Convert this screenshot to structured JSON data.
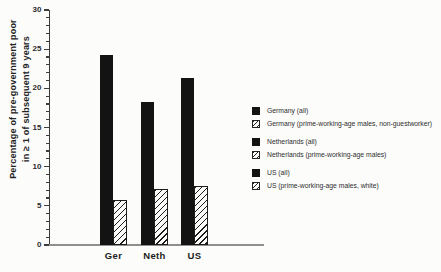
{
  "page": {
    "background": "#fcfcfb",
    "ink": "#161616"
  },
  "chart_data": {
    "type": "bar",
    "title": "",
    "xlabel": "",
    "ylabel_lines": [
      "Percentage of pre-government poor",
      "in ≥ 1 of subsequent 9 years"
    ],
    "ylim": [
      0,
      30
    ],
    "yticks": [
      0,
      5,
      10,
      15,
      20,
      25,
      30
    ],
    "ytick_step": 5,
    "minor_tick_step": 1,
    "grid": false,
    "categories": [
      "Ger",
      "Neth",
      "US"
    ],
    "series": [
      {
        "name": "all",
        "style": "solid",
        "color": "#131313",
        "values": [
          24.2,
          18.3,
          21.3
        ]
      },
      {
        "name": "prime-working-age males",
        "style": "hatched",
        "color": "#131313",
        "values": [
          5.8,
          7.2,
          7.5
        ]
      }
    ],
    "legend_position": "right",
    "legend_groups": [
      {
        "items": [
          {
            "label": "Germany (all)",
            "swatch": "solid"
          },
          {
            "label": "Germany (prime-working-age males, non-guestworker)",
            "swatch": "hatched"
          }
        ]
      },
      {
        "items": [
          {
            "label": "Netherlands (all)",
            "swatch": "solid"
          },
          {
            "label": "Netherlands (prime-working-age males)",
            "swatch": "hatched"
          }
        ]
      },
      {
        "items": [
          {
            "label": "US (all)",
            "swatch": "solid"
          },
          {
            "label": "US (prime-working-age males, white)",
            "swatch": "hatched"
          }
        ]
      }
    ]
  }
}
